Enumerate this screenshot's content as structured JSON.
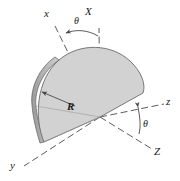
{
  "figure": {
    "background_color": "#ffffff",
    "line_color": "#4a4a4a",
    "label_color": "#1a1a1a",
    "plate_face_color": "#d2d2d2",
    "plate_edge_color": "#a8a8a8",
    "plate_outline_color": "#6b6b6b"
  },
  "labels": {
    "axis_x_lower": "x",
    "axis_y_lower": "y",
    "axis_z_lower": "z",
    "axis_X_upper": "X",
    "axis_Z_upper": "Z",
    "angle_top": "θ",
    "angle_bottom": "θ",
    "radius": "R"
  },
  "geometry": {
    "origin": [
      100,
      117
    ],
    "plate_radius_px": 68,
    "plate_arc_start_deg": 180,
    "plate_arc_end_deg": 350,
    "axis_x_end": [
      52,
      22
    ],
    "axis_y_end": [
      22,
      168
    ],
    "axis_z_end": [
      168,
      103
    ],
    "axis_X_end": [
      99,
      26
    ],
    "axis_Z_end": [
      155,
      152
    ],
    "radius_arrow_from": [
      74,
      105
    ],
    "radius_arrow_to": [
      42,
      92
    ]
  }
}
